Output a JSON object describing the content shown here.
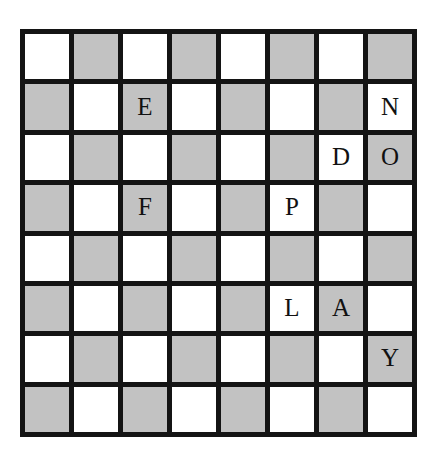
{
  "board": {
    "title": "Checkerboard Letter Grid",
    "rows": 8,
    "columns": 8,
    "colors": {
      "light_square": "#ffffff",
      "dark_square": "#c2c2c2",
      "grid_line": "#141414",
      "letter": "#111111",
      "background": "#ffffff"
    },
    "pattern": "checkerboard",
    "letter_cells": [
      {
        "row": 2,
        "col": 3,
        "letter": "E",
        "square": "dark"
      },
      {
        "row": 2,
        "col": 8,
        "letter": "N",
        "square": "light"
      },
      {
        "row": 3,
        "col": 7,
        "letter": "D",
        "square": "light"
      },
      {
        "row": 3,
        "col": 8,
        "letter": "O",
        "square": "dark"
      },
      {
        "row": 4,
        "col": 3,
        "letter": "F",
        "square": "dark"
      },
      {
        "row": 4,
        "col": 6,
        "letter": "P",
        "square": "light"
      },
      {
        "row": 6,
        "col": 6,
        "letter": "L",
        "square": "light"
      },
      {
        "row": 6,
        "col": 7,
        "letter": "A",
        "square": "dark"
      },
      {
        "row": 7,
        "col": 8,
        "letter": "Y",
        "square": "dark"
      }
    ],
    "grid": [
      [
        "",
        "",
        "",
        "",
        "",
        "",
        "",
        ""
      ],
      [
        "",
        "",
        "E",
        "",
        "",
        "",
        "",
        "N"
      ],
      [
        "",
        "",
        "",
        "",
        "",
        "",
        "D",
        "O"
      ],
      [
        "",
        "",
        "F",
        "",
        "",
        "P",
        "",
        ""
      ],
      [
        "",
        "",
        "",
        "",
        "",
        "",
        "",
        ""
      ],
      [
        "",
        "",
        "",
        "",
        "",
        "L",
        "A",
        ""
      ],
      [
        "",
        "",
        "",
        "",
        "",
        "",
        "",
        "Y"
      ],
      [
        "",
        "",
        "",
        "",
        "",
        "",
        "",
        ""
      ]
    ]
  }
}
